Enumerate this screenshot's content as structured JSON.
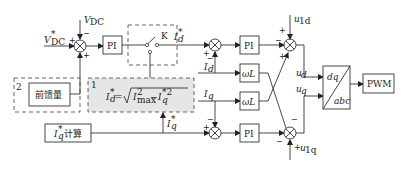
{
  "diagram": {
    "inputs": {
      "vdc_ref": "V*DC",
      "vdc_ref_main": "V",
      "vdc_ref_sup": "*",
      "vdc_ref_sub": "DC",
      "vdc_fb_main": "V",
      "vdc_fb_sub": "DC",
      "id_fb_main": "I",
      "id_fb_sub": "d",
      "iq_fb_main": "I",
      "iq_fb_sub": "q",
      "u1d_main": "u",
      "u1d_sub": "1d",
      "u1q_main": "u",
      "u1q_sub": "1q"
    },
    "signals": {
      "id_ref_main": "I",
      "id_ref_sup": "*",
      "id_ref_sub": "d",
      "iq_ref_main": "I",
      "iq_ref_sup": "*",
      "iq_ref_sub": "q",
      "ud_main": "u",
      "ud_sub": "d",
      "uq_main": "u",
      "uq_sub": "q"
    },
    "blocks": {
      "pi_voltage": "PI",
      "switch_label": "K",
      "pi_d": "PI",
      "pi_q": "PI",
      "omega_l_d": "ωL",
      "omega_l_q": "ωL",
      "transform_top": "dq",
      "transform_bottom": "abc",
      "pwm": "PWM",
      "feedforward": "前馈量",
      "iq_calc_suffix": "计算",
      "formula": "I*d = √(I²max − I*q²)"
    },
    "regions": {
      "region_1_number": "1",
      "region_2_number": "2"
    },
    "signs": {
      "s1_left": "+",
      "s1_top": "−",
      "s1_bottom": "+",
      "s2_left": "+",
      "s2_bottom": "−",
      "s3_top": "+",
      "s3_left": "−",
      "s3_bottom": "+",
      "s4_left": "+",
      "s4_top": "−",
      "s5_top": "−",
      "s5_left": "−",
      "s5_right": "+"
    }
  }
}
